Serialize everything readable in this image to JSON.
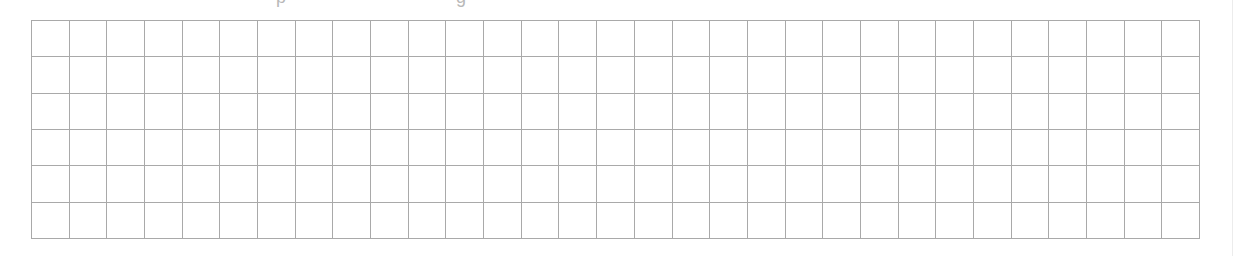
{
  "document": {
    "clipped_text_fragments": [
      {
        "x": 276,
        "glyph": "p"
      },
      {
        "x": 456,
        "glyph": "g"
      }
    ],
    "grid": {
      "rows": 6,
      "columns": 31,
      "line_color": "#a9a9a9",
      "background": "#ffffff"
    }
  }
}
